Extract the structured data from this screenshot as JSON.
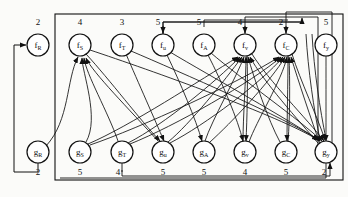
{
  "figure": {
    "caption": "",
    "background": "#fbfbf9",
    "ink": "#111111"
  },
  "outer_box": {
    "x": 55,
    "y": 14,
    "w": 288,
    "h": 166
  },
  "rows": {
    "top_row_y": 45,
    "bottom_row_y": 152,
    "node_radius": 11
  },
  "top_numbers": [
    "2",
    "4",
    "3",
    "5",
    "5",
    "4",
    "2",
    "5"
  ],
  "bottom_numbers": [
    "2",
    "5",
    "4",
    "5",
    "5",
    "4",
    "5",
    "2"
  ],
  "top_nodes": [
    {
      "id": "fR",
      "base": "f",
      "sub": "R",
      "cx": 38,
      "num": "2"
    },
    {
      "id": "fS",
      "base": "f",
      "sub": "S",
      "cx": 80,
      "num": "4"
    },
    {
      "id": "fT",
      "base": "f",
      "sub": "T",
      "cx": 122,
      "num": "3"
    },
    {
      "id": "fu",
      "base": "f",
      "sub": "u",
      "cx": 163,
      "num": "5"
    },
    {
      "id": "fA",
      "base": "f",
      "sub": "A",
      "cx": 204,
      "num": "5"
    },
    {
      "id": "fv",
      "base": "f",
      "sub": "v",
      "cx": 245,
      "num": "4"
    },
    {
      "id": "fC",
      "base": "f",
      "sub": "C",
      "cx": 286,
      "num": "2"
    },
    {
      "id": "fy",
      "base": "f",
      "sub": "y",
      "cx": 326,
      "num": "5"
    }
  ],
  "bottom_nodes": [
    {
      "id": "gR",
      "base": "g",
      "sub": "R",
      "cx": 38,
      "num": "2"
    },
    {
      "id": "gS",
      "base": "g",
      "sub": "S",
      "cx": 80,
      "num": "5"
    },
    {
      "id": "gT",
      "base": "g",
      "sub": "T",
      "cx": 122,
      "num": "4"
    },
    {
      "id": "gu",
      "base": "g",
      "sub": "u",
      "cx": 163,
      "num": "5"
    },
    {
      "id": "gA",
      "base": "g",
      "sub": "A",
      "cx": 204,
      "num": "5"
    },
    {
      "id": "gv",
      "base": "g",
      "sub": "v",
      "cx": 245,
      "num": "4"
    },
    {
      "id": "gC",
      "base": "g",
      "sub": "C",
      "cx": 286,
      "num": "5"
    },
    {
      "id": "gy",
      "base": "g",
      "sub": "y",
      "cx": 326,
      "num": "2"
    }
  ],
  "edges_bottom_to_top": [
    {
      "from": "gR",
      "to": "fS"
    },
    {
      "from": "gS",
      "to": "fS"
    },
    {
      "from": "gT",
      "to": "fS"
    },
    {
      "from": "gu",
      "to": "fS"
    },
    {
      "from": "gS",
      "to": "fv"
    },
    {
      "from": "gT",
      "to": "fv"
    },
    {
      "from": "gu",
      "to": "fv"
    },
    {
      "from": "gA",
      "to": "fv"
    },
    {
      "from": "gv",
      "to": "fv"
    },
    {
      "from": "gC",
      "to": "fv"
    },
    {
      "from": "gy",
      "to": "fv"
    },
    {
      "from": "gS",
      "to": "fC"
    },
    {
      "from": "gT",
      "to": "fC"
    },
    {
      "from": "gu",
      "to": "fC"
    },
    {
      "from": "gA",
      "to": "fC"
    },
    {
      "from": "gv",
      "to": "fC"
    },
    {
      "from": "gC",
      "to": "fC"
    },
    {
      "from": "gy",
      "to": "fC"
    }
  ],
  "edges_top_to_bottom": [
    {
      "from": "fS",
      "to": "gu"
    },
    {
      "from": "fT",
      "to": "gu"
    },
    {
      "from": "fu",
      "to": "gA"
    },
    {
      "from": "fA",
      "to": "gv"
    },
    {
      "from": "fv",
      "to": "gv"
    },
    {
      "from": "fC",
      "to": "gC"
    },
    {
      "from": "fy",
      "to": "gy"
    },
    {
      "from": "fu",
      "to": "gy"
    },
    {
      "from": "fA",
      "to": "gy"
    },
    {
      "from": "fv",
      "to": "gy"
    },
    {
      "from": "fC",
      "to": "gy"
    },
    {
      "from": "fS",
      "to": "gy"
    },
    {
      "from": "fT",
      "to": "gy"
    }
  ],
  "routed_edges": [
    {
      "name": "gR-to-fR-feedback",
      "from": "gR",
      "to": "fR"
    },
    {
      "name": "busline-to-fu",
      "to": "fu"
    },
    {
      "name": "busline-to-fv",
      "to": "fv"
    },
    {
      "name": "busline-to-fC",
      "to": "fC"
    },
    {
      "name": "gT-bus-return",
      "from": "gT"
    },
    {
      "name": "gy-bus-return",
      "from": "gy"
    }
  ]
}
